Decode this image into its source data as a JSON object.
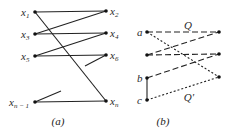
{
  "panel_a": {
    "caption": "(a)",
    "left_nodes": [
      {
        "id": "x1",
        "base": "x",
        "sub": "1"
      },
      {
        "id": "x3",
        "base": "x",
        "sub": "3"
      },
      {
        "id": "x5",
        "base": "x",
        "sub": "5"
      },
      {
        "id": "xn-1",
        "base": "x",
        "sub": "n − 1"
      }
    ],
    "right_nodes": [
      {
        "id": "x2",
        "base": "x",
        "sub": "2"
      },
      {
        "id": "x4",
        "base": "x",
        "sub": "4"
      },
      {
        "id": "x6",
        "base": "x",
        "sub": "6"
      },
      {
        "id": "xn",
        "base": "x",
        "sub": "n"
      }
    ],
    "edges": [
      [
        "x1",
        "x2"
      ],
      [
        "x1",
        "xn"
      ],
      [
        "x3",
        "x2"
      ],
      [
        "x3",
        "x4"
      ],
      [
        "x5",
        "x4"
      ],
      [
        "x5",
        "x6"
      ],
      [
        "xn-1",
        "xn"
      ]
    ],
    "partial_edges": [
      "x6",
      "xn-1"
    ]
  },
  "panel_b": {
    "caption": "(b)",
    "left_nodes": [
      {
        "id": "a",
        "label": "a"
      },
      {
        "id": "l2",
        "label": ""
      },
      {
        "id": "b",
        "label": "b"
      },
      {
        "id": "c",
        "label": "c"
      }
    ],
    "right_nodes": [
      {
        "id": "r1",
        "label": ""
      },
      {
        "id": "r2",
        "label": ""
      },
      {
        "id": "r3",
        "label": ""
      }
    ],
    "path_Q_label": "Q",
    "path_Qprime_label": "Q′",
    "edges_Q": [
      [
        "a",
        "r1"
      ],
      [
        "l2",
        "r1"
      ],
      [
        "l2",
        "r2"
      ],
      [
        "b",
        "r2"
      ]
    ],
    "edges_Qprime": [
      [
        "a",
        "r3"
      ],
      [
        "c",
        "r3"
      ]
    ],
    "edges_solid": [
      [
        "b",
        "c"
      ]
    ]
  }
}
